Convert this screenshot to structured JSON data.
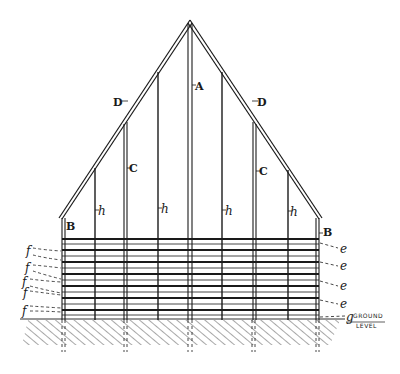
{
  "figure": {
    "type": "technical-line-drawing",
    "colors": {
      "ink": "#1a1a1a",
      "background": "#ffffff"
    }
  },
  "labels": {
    "apex_post": "A",
    "eave_left": "B",
    "eave_right": "B",
    "stud_left": "C",
    "stud_right": "C",
    "rafter_left": "D",
    "rafter_right": "D",
    "h_1": "h",
    "h_2": "h",
    "h_3": "h",
    "h_4": "h",
    "left_slats": [
      "f",
      "f",
      "f",
      "f",
      "f"
    ],
    "right_slats": [
      "e",
      "e",
      "e",
      "e"
    ],
    "ground_marker": "g",
    "ground_line_1": "GROUND",
    "ground_line_2": "LEVEL"
  },
  "geometry": {
    "apex": [
      190,
      22
    ],
    "eave_left": [
      62,
      218
    ],
    "eave_right": [
      320,
      218
    ],
    "ground_y": 318,
    "wall_top_y": 238,
    "posts_x": [
      62,
      95,
      126,
      158,
      190,
      222,
      254,
      288,
      320
    ],
    "slat_rows": 10
  }
}
